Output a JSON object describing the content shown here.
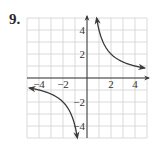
{
  "problem": {
    "number_label": "9."
  },
  "chart_data": {
    "type": "line",
    "title": "",
    "xlabel": "",
    "ylabel": "",
    "xlim": [
      -5,
      5
    ],
    "ylim": [
      -5,
      5
    ],
    "grid": true,
    "x_ticks": [
      -4,
      -2,
      2,
      4
    ],
    "y_ticks": [
      4,
      2,
      -2,
      -4
    ],
    "x_tick_labels": [
      "−4",
      "−2",
      "2",
      "4"
    ],
    "y_tick_labels": [
      "4",
      "2",
      "−2",
      "−4"
    ],
    "series": [
      {
        "name": "y = 4/x (x>0)",
        "x": [
          0.8,
          1,
          1.5,
          2,
          3,
          4,
          4.8
        ],
        "y": [
          5,
          4,
          2.67,
          2,
          1.33,
          1,
          0.83
        ]
      },
      {
        "name": "y = 4/x (x<0)",
        "x": [
          -4.8,
          -4,
          -3,
          -2,
          -1.5,
          -1,
          -0.8
        ],
        "y": [
          -0.83,
          -1,
          -1.33,
          -2,
          -2.67,
          -4,
          -5
        ]
      }
    ],
    "colors": {
      "curve": "#3a3a3a",
      "axis": "#3a3a3a",
      "grid": "#d0d0d0"
    }
  }
}
